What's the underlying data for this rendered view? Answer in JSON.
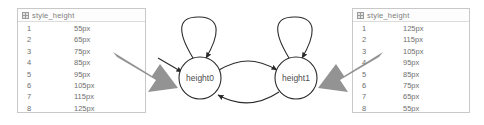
{
  "canvas": {
    "background": "#ffffff",
    "width": 484,
    "height": 125
  },
  "tables": {
    "left": {
      "title": "style_height",
      "icon": "grid-icon",
      "rows": [
        {
          "index": "1",
          "value": "55px"
        },
        {
          "index": "2",
          "value": "65px"
        },
        {
          "index": "3",
          "value": "75px"
        },
        {
          "index": "4",
          "value": "85px"
        },
        {
          "index": "5",
          "value": "95px"
        },
        {
          "index": "6",
          "value": "105px"
        },
        {
          "index": "7",
          "value": "115px"
        },
        {
          "index": "8",
          "value": "125px"
        }
      ]
    },
    "right": {
      "title": "style_height",
      "icon": "grid-icon",
      "rows": [
        {
          "index": "1",
          "value": "125px"
        },
        {
          "index": "2",
          "value": "115px"
        },
        {
          "index": "3",
          "value": "105px"
        },
        {
          "index": "4",
          "value": "95px"
        },
        {
          "index": "5",
          "value": "85px"
        },
        {
          "index": "6",
          "value": "75px"
        },
        {
          "index": "7",
          "value": "65px"
        },
        {
          "index": "8",
          "value": "55px"
        }
      ]
    }
  },
  "diagram": {
    "type": "state-machine",
    "nodes": [
      {
        "id": "height0",
        "label": "height0",
        "cx": 200,
        "cy": 78,
        "r": 21
      },
      {
        "id": "height1",
        "label": "height1",
        "cx": 296,
        "cy": 78,
        "r": 21
      }
    ],
    "edges": [
      {
        "from": "height0",
        "to": "height0",
        "kind": "self-loop"
      },
      {
        "from": "height1",
        "to": "height1",
        "kind": "self-loop"
      },
      {
        "from": "height0",
        "to": "height1",
        "kind": "curve-top"
      },
      {
        "from": "height1",
        "to": "height0",
        "kind": "curve-bottom"
      },
      {
        "from": "external",
        "to": "height0",
        "kind": "incoming"
      }
    ],
    "colors": {
      "stroke": "#2b2b2b",
      "node_fill": "#ffffff",
      "label": "#4d4d4d",
      "pointer": "#808080"
    }
  },
  "annotations": {
    "pointer_left": "arrow-pointing-to-height0",
    "pointer_right": "arrow-pointing-to-height1"
  }
}
